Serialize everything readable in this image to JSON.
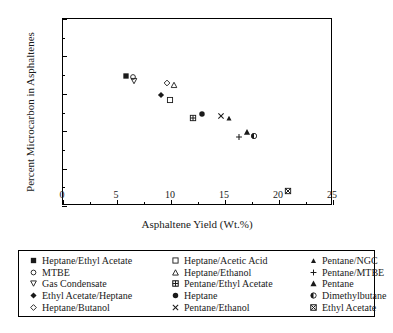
{
  "chart_data": {
    "type": "scatter",
    "title": "",
    "xlabel": "Asphaltene Yield (Wt.%)",
    "ylabel": "Percent Microcarbon in Asphaltenes",
    "xlim": [
      0,
      25
    ],
    "ylim": [
      35,
      60
    ],
    "xticks": [
      0,
      5,
      10,
      15,
      20,
      25
    ],
    "yticks": [
      35,
      40,
      45,
      50,
      55,
      60
    ],
    "xticklabels": [
      "0",
      "5",
      "10",
      "15",
      "20",
      "25"
    ],
    "yticklabels": [
      "35",
      "40",
      "45",
      "50",
      "55",
      "60"
    ],
    "grid": false,
    "legend_position": "below-plot",
    "marker_color": "#1a1a1a",
    "series": [
      {
        "name": "Heptane/Ethyl Acetate",
        "marker": "filled-square",
        "x": 5.8,
        "y": 52.4
      },
      {
        "name": "MTBE",
        "marker": "open-circle",
        "x": 6.5,
        "y": 52.3
      },
      {
        "name": "Gas Condensate",
        "marker": "open-down-triangle",
        "x": 6.6,
        "y": 51.7
      },
      {
        "name": "Ethyl Acetate/Heptane",
        "marker": "filled-diamond",
        "x": 9.1,
        "y": 49.9
      },
      {
        "name": "Heptane/Butanol",
        "marker": "open-diamond",
        "x": 9.6,
        "y": 51.5
      },
      {
        "name": "Heptane/Acetic Acid",
        "marker": "open-square",
        "x": 9.9,
        "y": 49.2
      },
      {
        "name": "Heptane/Ethanol",
        "marker": "open-up-triangle",
        "x": 10.3,
        "y": 51.2
      },
      {
        "name": "Pentane/Ethyl Acetate",
        "marker": "grid-square",
        "x": 12.0,
        "y": 46.7
      },
      {
        "name": "Heptane",
        "marker": "filled-circle",
        "x": 12.9,
        "y": 47.3
      },
      {
        "name": "Pentane/Ethanol",
        "marker": "cross-x",
        "x": 14.6,
        "y": 47.0
      },
      {
        "name": "Pentane/NGC",
        "marker": "small-filled-triangle",
        "x": 15.4,
        "y": 46.8
      },
      {
        "name": "Pentane/MTBE",
        "marker": "plus",
        "x": 16.3,
        "y": 44.2
      },
      {
        "name": "Pentane",
        "marker": "filled-triangle",
        "x": 17.0,
        "y": 44.9
      },
      {
        "name": "Dimethylbutane",
        "marker": "half-filled-circle",
        "x": 17.7,
        "y": 44.3
      },
      {
        "name": "Ethyl Acetate",
        "marker": "boxed-x",
        "x": 20.8,
        "y": 37.0
      }
    ]
  },
  "legend": {
    "columns": [
      {
        "items": [
          {
            "label": "Heptane/Ethyl Acetate",
            "marker": "filled-square"
          },
          {
            "label": "MTBE",
            "marker": "open-circle"
          },
          {
            "label": "Gas Condensate",
            "marker": "open-down-triangle"
          },
          {
            "label": "Ethyl Acetate/Heptane",
            "marker": "filled-diamond"
          },
          {
            "label": "Heptane/Butanol",
            "marker": "open-diamond"
          }
        ]
      },
      {
        "items": [
          {
            "label": "Heptane/Acetic Acid",
            "marker": "open-square"
          },
          {
            "label": "Heptane/Ethanol",
            "marker": "open-up-triangle"
          },
          {
            "label": "Pentane/Ethyl Acetate",
            "marker": "grid-square"
          },
          {
            "label": "Heptane",
            "marker": "filled-circle"
          },
          {
            "label": "Pentane/Ethanol",
            "marker": "cross-x"
          }
        ]
      },
      {
        "items": [
          {
            "label": "Pentane/NGC",
            "marker": "small-filled-triangle"
          },
          {
            "label": "Pentane/MTBE",
            "marker": "plus"
          },
          {
            "label": "Pentane",
            "marker": "filled-triangle"
          },
          {
            "label": "Dimethylbutane",
            "marker": "half-filled-circle"
          },
          {
            "label": "Ethyl Acetate",
            "marker": "boxed-x"
          }
        ]
      }
    ]
  }
}
